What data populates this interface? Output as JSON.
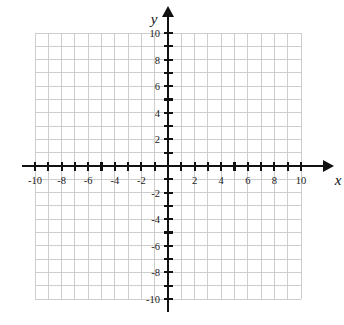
{
  "figure": {
    "kind": "cartesian-coordinate-grid",
    "background_color": "#ffffff",
    "grid_line_color": "#c9c9c9",
    "axis_color": "#111111"
  },
  "axes": {
    "x": {
      "name": "x",
      "min": -10,
      "max": 10,
      "tick_step": 1,
      "label_step": 2,
      "arrow": "right",
      "tick_labels": [
        "-10",
        "-8",
        "-6",
        "-4",
        "-2",
        "2",
        "4",
        "6",
        "8",
        "10"
      ],
      "tick_values": [
        -10,
        -8,
        -6,
        -4,
        -2,
        2,
        4,
        6,
        8,
        10
      ]
    },
    "y": {
      "name": "y",
      "min": -10,
      "max": 10,
      "tick_step": 1,
      "label_step": 2,
      "arrow": "up",
      "tick_labels": [
        "10",
        "8",
        "6",
        "4",
        "2",
        "-2",
        "-4",
        "-6",
        "-8",
        "-10"
      ],
      "tick_values": [
        10,
        8,
        6,
        4,
        2,
        -2,
        -4,
        -6,
        -8,
        -10
      ]
    }
  },
  "chart_data": {
    "type": "scatter",
    "title": "",
    "subtitle": "",
    "xlabel": "x",
    "ylabel": "y",
    "xlim": [
      -10,
      10
    ],
    "ylim": [
      -10,
      10
    ],
    "xticks": [
      -10,
      -9,
      -8,
      -7,
      -6,
      -5,
      -4,
      -3,
      -2,
      -1,
      0,
      1,
      2,
      3,
      4,
      5,
      6,
      7,
      8,
      9,
      10
    ],
    "yticks": [
      -10,
      -9,
      -8,
      -7,
      -6,
      -5,
      -4,
      -3,
      -2,
      -1,
      0,
      1,
      2,
      3,
      4,
      5,
      6,
      7,
      8,
      9,
      10
    ],
    "xtick_labels": [
      "-10",
      "-8",
      "-6",
      "-4",
      "-2",
      "2",
      "4",
      "6",
      "8",
      "10"
    ],
    "ytick_labels": [
      "10",
      "8",
      "6",
      "4",
      "2",
      "-2",
      "-4",
      "-6",
      "-8",
      "-10"
    ],
    "grid": true,
    "grid_spacing": 1,
    "legend": null,
    "legend_position": "none",
    "series": [],
    "annotations": []
  },
  "labels": {
    "x_axis_name": "x",
    "y_axis_name": "y",
    "x_neg_10": "-10",
    "x_neg_8": "-8",
    "x_neg_6": "-6",
    "x_neg_4": "-4",
    "x_neg_2": "-2",
    "x_pos_2": "2",
    "x_pos_4": "4",
    "x_pos_6": "6",
    "x_pos_8": "8",
    "x_pos_10": "10",
    "y_pos_10": "10",
    "y_pos_8": "8",
    "y_pos_6": "6",
    "y_pos_4": "4",
    "y_pos_2": "2",
    "y_neg_2": "-2",
    "y_neg_4": "-4",
    "y_neg_6": "-6",
    "y_neg_8": "-8",
    "y_neg_10": "-10"
  }
}
